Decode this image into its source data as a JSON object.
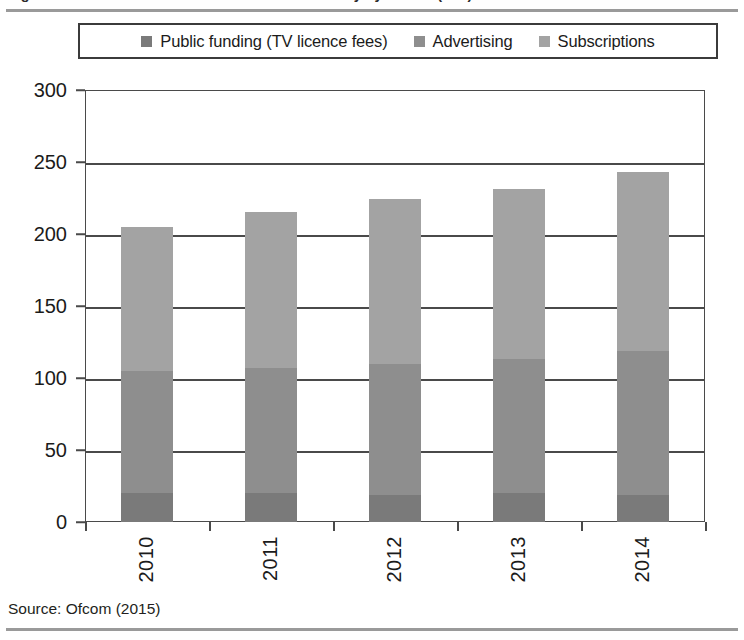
{
  "figure": {
    "title_cropped": "Figure 1: Total revenue of the UK television industry by source (£bn)",
    "source_note": "Source: Ofcom (2015)"
  },
  "legend": {
    "position": "top",
    "items": [
      {
        "label": "Public funding (TV licence fees)",
        "color": "#7a7a7a"
      },
      {
        "label": "Advertising",
        "color": "#8e8e8e"
      },
      {
        "label": "Subscriptions",
        "color": "#a3a3a3"
      }
    ]
  },
  "axes": {
    "y_ticks": [
      "0",
      "50",
      "100",
      "150",
      "200",
      "250",
      "300"
    ],
    "x_ticks": [
      "2010",
      "2011",
      "2012",
      "2013",
      "2014"
    ]
  },
  "chart_data": {
    "type": "bar",
    "stacked": true,
    "title": "Figure 1: Total revenue of the UK television industry by source (£bn)",
    "xlabel": "",
    "ylabel": "",
    "ylim": [
      0,
      300
    ],
    "ytick_step": 50,
    "grid": true,
    "legend_position": "top",
    "categories": [
      "2010",
      "2011",
      "2012",
      "2013",
      "2014"
    ],
    "series": [
      {
        "name": "Public funding (TV licence fees)",
        "color": "#7a7a7a",
        "values": [
          20,
          20,
          19,
          20,
          19
        ]
      },
      {
        "name": "Advertising",
        "color": "#8e8e8e",
        "values": [
          85,
          87,
          91,
          93,
          100
        ]
      },
      {
        "name": "Subscriptions",
        "color": "#a3a3a3",
        "values": [
          100,
          108,
          114,
          118,
          124
        ]
      }
    ],
    "totals": [
      205,
      215,
      224,
      231,
      243
    ],
    "source": "Ofcom (2015)"
  }
}
